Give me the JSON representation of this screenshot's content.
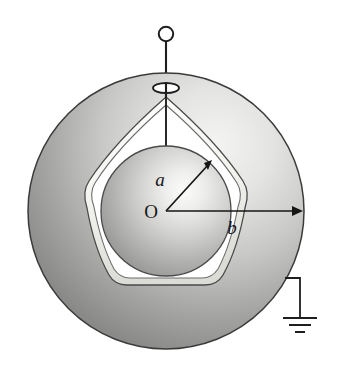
{
  "figure": {
    "labels": {
      "inner_radius": "a",
      "center": "O",
      "outer_radius": "b"
    },
    "parts": {
      "terminal_knob": "terminal-knob",
      "lead_wire": "lead-wire",
      "shell_hole": "shell-hole",
      "outer_shell": "outer-shell",
      "cavity": "cavity",
      "inner_sphere": "inner-sphere",
      "ground_wire": "ground-wire",
      "ground_symbol": "ground-symbol",
      "radius_a_arrow": "radius-a-arrow",
      "radius_b_arrow": "radius-b-arrow"
    },
    "geometry": {
      "center_x": 166,
      "center_y": 211,
      "outer_radius_px": 138,
      "inner_sphere_radius_px": 65,
      "cavity_inner_radius_px": 96
    },
    "colors": {
      "shell_light": "#e9e9e9",
      "shell_mid": "#b9b9b9",
      "shell_dark": "#838383",
      "shell_darkest": "#6f6f6f",
      "sphere_light": "#f2f2f2",
      "sphere_mid": "#bdbdbd",
      "sphere_dark": "#8d8d8d",
      "rim_highlight": "#f7f7f4",
      "outline": "#2b2b2b",
      "background": "#ffffff",
      "cavity_void": "#ffffff"
    }
  }
}
